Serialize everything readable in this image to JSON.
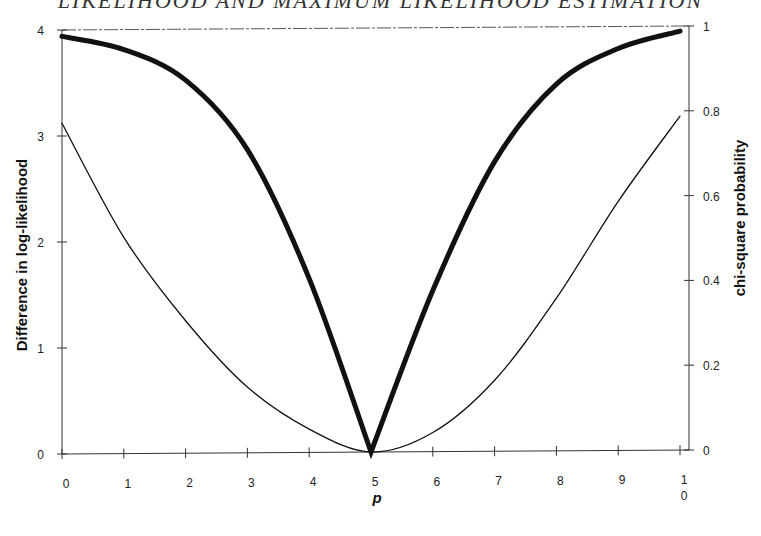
{
  "header": {
    "text": "LIKELIHOOD AND MAXIMUM LIKELIHOOD ESTIMATION"
  },
  "chart_data": {
    "type": "line",
    "title": "",
    "xlabel": "p",
    "ylabel": "Difference in log-likelihood",
    "y2label": "chi-square probability",
    "x": [
      0,
      1,
      2,
      3,
      4,
      5,
      6,
      7,
      8,
      9,
      10
    ],
    "x_tick_labels": [
      "0",
      "1",
      "2",
      "3",
      "4",
      "5",
      "6",
      "7",
      "8",
      "9",
      "1\n0"
    ],
    "xlim": [
      0,
      10
    ],
    "ylim": [
      0,
      4
    ],
    "y_ticks": [
      "0",
      "1",
      "2",
      "3",
      "4"
    ],
    "y2lim": [
      0,
      1
    ],
    "y2_ticks": [
      "0",
      "0.2",
      "0.4",
      "0.6",
      "0.8",
      "1"
    ],
    "grid": false,
    "legend": null,
    "series": [
      {
        "name": "Difference in log-likelihood",
        "axis": "left",
        "style": "thin",
        "values": [
          3.12,
          2.04,
          1.25,
          0.62,
          0.22,
          0.0,
          0.18,
          0.67,
          1.44,
          2.35,
          3.15
        ]
      },
      {
        "name": "chi-square probability",
        "axis": "right",
        "style": "thick",
        "values": [
          0.985,
          0.953,
          0.88,
          0.715,
          0.41,
          0.0,
          0.38,
          0.683,
          0.865,
          0.948,
          0.988
        ]
      }
    ]
  }
}
